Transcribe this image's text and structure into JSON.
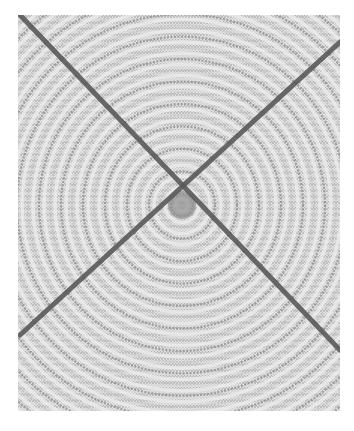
{
  "image": {
    "subject": "Woven circular rope mat with two crossing dark cords forming an X",
    "colors": {
      "background": "#ffffff",
      "weave_light": "#ececec",
      "weave_mid": "#bdbdbd",
      "weave_dark": "#8a8a8a",
      "cord": "#5a5a5a"
    },
    "center": [
      164,
      190
    ],
    "rings": 24,
    "cords": [
      {
        "x1": 2,
        "y1": 0,
        "x2": 322,
        "y2": 335
      },
      {
        "x1": 322,
        "y1": 27,
        "x2": 2,
        "y2": 320
      }
    ]
  }
}
